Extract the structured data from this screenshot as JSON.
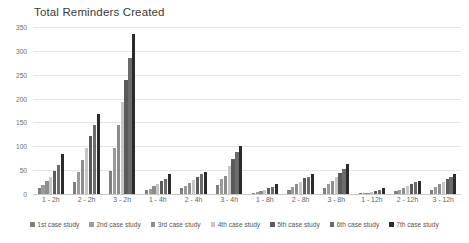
{
  "chart_data": {
    "type": "bar",
    "title": "Total Reminders Created",
    "xlabel": "",
    "ylabel": "",
    "ylim": [
      0,
      350
    ],
    "yticks": [
      0,
      50,
      100,
      150,
      200,
      250,
      300,
      350
    ],
    "grid": true,
    "legend_position": "bottom",
    "categories": [
      "1 - 2h",
      "2 - 2h",
      "3 - 2h",
      "1 - 4h",
      "2 - 4h",
      "3 - 4h",
      "1 - 8h",
      "2 - 8h",
      "3 - 8h",
      "1 - 12h",
      "2 - 12h",
      "3 - 12h"
    ],
    "series": [
      {
        "name": "1st case study",
        "color": "#7f7f7f",
        "values": [
          12,
          26,
          48,
          8,
          12,
          18,
          3,
          9,
          12,
          1,
          6,
          9
        ]
      },
      {
        "name": "2nd case study",
        "color": "#9a9a9a",
        "values": [
          19,
          47,
          96,
          11,
          17,
          31,
          5,
          14,
          20,
          2,
          9,
          14
        ]
      },
      {
        "name": "3rd case study",
        "color": "#8d8d8d",
        "values": [
          27,
          71,
          144,
          16,
          23,
          38,
          7,
          20,
          27,
          3,
          13,
          20
        ]
      },
      {
        "name": "4th case study",
        "color": "#c6c6c6",
        "values": [
          35,
          96,
          192,
          22,
          30,
          59,
          9,
          26,
          35,
          5,
          17,
          25
        ]
      },
      {
        "name": "5th case study",
        "color": "#5a5a5a",
        "values": [
          48,
          121,
          240,
          27,
          36,
          74,
          12,
          33,
          45,
          7,
          21,
          31
        ]
      },
      {
        "name": "6th case study",
        "color": "#6b6b6b",
        "values": [
          61,
          145,
          286,
          32,
          41,
          88,
          15,
          36,
          52,
          9,
          25,
          36
        ]
      },
      {
        "name": "7th case study",
        "color": "#2b2b2b",
        "values": [
          83,
          168,
          335,
          41,
          47,
          101,
          21,
          41,
          62,
          12,
          28,
          41
        ]
      }
    ]
  }
}
